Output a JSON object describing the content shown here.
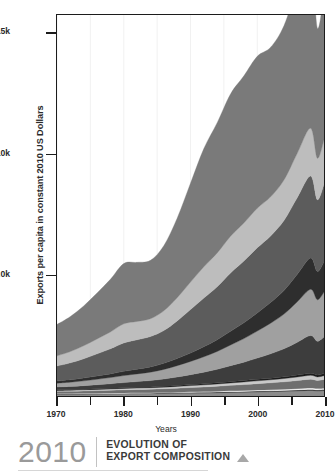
{
  "axes": {
    "ylabel": "Exports per capita in constant 2010 US Dollars",
    "xlabel": "Years",
    "yticks": [
      {
        "value": 15000,
        "label": "15k"
      },
      {
        "value": 10000,
        "label": "10k"
      },
      {
        "value": 5000,
        "label": "5.0k"
      }
    ],
    "xticks_major": [
      {
        "value": 1970,
        "label": "1970"
      },
      {
        "value": 1980,
        "label": "1980"
      },
      {
        "value": 1990,
        "label": "1990"
      },
      {
        "value": 2000,
        "label": "2000"
      },
      {
        "value": 2010,
        "label": "2010"
      }
    ],
    "xticks_minor": [
      {
        "value": 1975,
        "label": ""
      },
      {
        "value": 1985,
        "label": ""
      },
      {
        "value": 1995,
        "label": ""
      },
      {
        "value": 2005,
        "label": ""
      }
    ]
  },
  "footer": {
    "year": "2010",
    "title_line1": "EVOLUTION OF",
    "title_line2": "EXPORT COMPOSITION",
    "marker_icon": "triangle-up-icon"
  },
  "chart_data": {
    "type": "area",
    "stacked": true,
    "title": "EVOLUTION OF EXPORT COMPOSITION",
    "xlabel": "Years",
    "ylabel": "Exports per capita in constant 2010 US Dollars",
    "xlim": [
      1970,
      2010
    ],
    "ylim": [
      0,
      15800
    ],
    "grid": "vertical-light",
    "legend": "none",
    "x": [
      1970,
      1972,
      1974,
      1976,
      1978,
      1980,
      1982,
      1984,
      1986,
      1988,
      1990,
      1992,
      1994,
      1996,
      1998,
      2000,
      2002,
      2004,
      2006,
      2008,
      2009,
      2010
    ],
    "series": [
      {
        "name": "band-01",
        "color": "#8c8c8c",
        "values": [
          70,
          72,
          76,
          80,
          84,
          90,
          94,
          98,
          104,
          112,
          120,
          128,
          138,
          150,
          160,
          172,
          182,
          196,
          214,
          232,
          214,
          228
        ]
      },
      {
        "name": "band-02",
        "color": "#1c1c1c",
        "values": [
          14,
          14,
          15,
          15,
          16,
          17,
          18,
          18,
          19,
          20,
          22,
          23,
          25,
          27,
          29,
          31,
          33,
          35,
          38,
          41,
          38,
          40
        ]
      },
      {
        "name": "band-03",
        "color": "#f2f2f2",
        "values": [
          18,
          18,
          19,
          20,
          21,
          22,
          23,
          24,
          26,
          28,
          30,
          32,
          34,
          37,
          40,
          43,
          46,
          49,
          53,
          58,
          54,
          57
        ]
      },
      {
        "name": "band-04",
        "color": "#6e6e6e",
        "values": [
          90,
          95,
          102,
          110,
          118,
          128,
          135,
          142,
          152,
          166,
          180,
          194,
          210,
          228,
          246,
          266,
          286,
          308,
          336,
          366,
          338,
          360
        ]
      },
      {
        "name": "band-05",
        "color": "#c9c9c9",
        "values": [
          40,
          42,
          45,
          48,
          52,
          56,
          59,
          62,
          67,
          73,
          79,
          85,
          92,
          100,
          108,
          117,
          126,
          136,
          148,
          161,
          149,
          159
        ]
      },
      {
        "name": "band-06",
        "color": "#1c1c1c",
        "values": [
          22,
          23,
          24,
          26,
          28,
          30,
          32,
          33,
          36,
          39,
          42,
          45,
          49,
          53,
          58,
          62,
          67,
          72,
          79,
          86,
          79,
          85
        ]
      },
      {
        "name": "band-07",
        "color": "#3d3d3d",
        "values": [
          120,
          132,
          148,
          168,
          188,
          212,
          236,
          262,
          300,
          350,
          410,
          480,
          560,
          660,
          760,
          880,
          1010,
          1160,
          1360,
          1560,
          1400,
          1520
        ]
      },
      {
        "name": "band-08",
        "color": "#a0a0a0",
        "values": [
          160,
          178,
          200,
          228,
          258,
          292,
          320,
          350,
          400,
          470,
          550,
          640,
          740,
          860,
          980,
          1120,
          1270,
          1440,
          1680,
          1920,
          1720,
          1860
        ]
      },
      {
        "name": "band-09",
        "color": "#2e2e2e",
        "values": [
          90,
          100,
          115,
          132,
          152,
          175,
          195,
          216,
          250,
          295,
          350,
          412,
          485,
          570,
          655,
          755,
          860,
          980,
          1140,
          1300,
          1170,
          1260
        ]
      },
      {
        "name": "band-10",
        "color": "#5c5c5c",
        "values": [
          620,
          700,
          800,
          920,
          1040,
          1180,
          1220,
          1260,
          1360,
          1560,
          1800,
          2020,
          2200,
          2420,
          2560,
          2700,
          2760,
          2900,
          3180,
          3400,
          2980,
          3200
        ]
      },
      {
        "name": "band-11",
        "color": "#bdbdbd",
        "values": [
          420,
          470,
          540,
          620,
          700,
          790,
          760,
          740,
          820,
          960,
          1140,
          1300,
          1400,
          1520,
          1580,
          1640,
          1620,
          1680,
          1840,
          1980,
          1720,
          1860
        ]
      },
      {
        "name": "band-12",
        "color": "#7a7a7a",
        "values": [
          1300,
          1450,
          1650,
          1900,
          2180,
          2500,
          2450,
          2420,
          2700,
          3300,
          4100,
          4900,
          5400,
          5900,
          6100,
          6300,
          6200,
          6400,
          6900,
          7100,
          5400,
          6100
        ]
      }
    ],
    "totals": [
      2964,
      3294,
      3734,
      4269,
      4837,
      5492,
      5542,
      5635,
      6234,
      7373,
      8823,
      10259,
      11333,
      12525,
      13276,
      14086,
      14456,
      15256,
      16968,
      18204,
      15262,
      16729
    ]
  }
}
